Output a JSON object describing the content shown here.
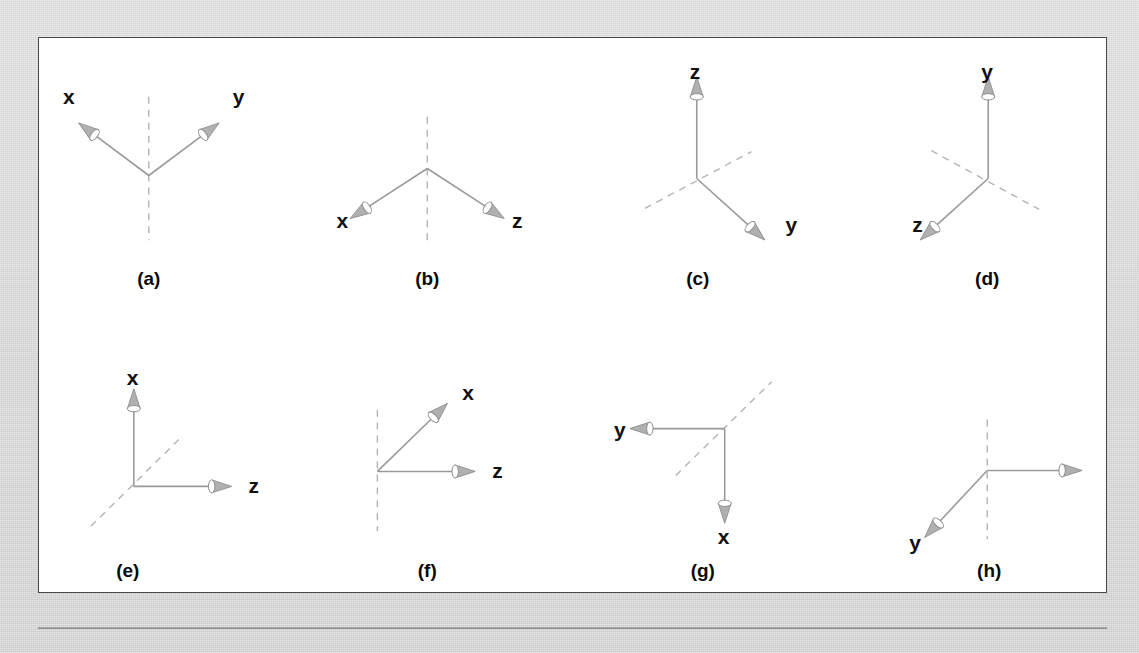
{
  "figure": {
    "background_color": "#d5d5d5",
    "panel_background": "#ffffff",
    "border_color": "#4a4a4a",
    "axis_color": "#9a9a9a",
    "dashed_color": "#b4b4b4",
    "arrow_fill": "#b0b0b0",
    "arrow_stroke": "#8d8d8d",
    "label_color": "#111111",
    "caption_color": "#0a0a0a"
  },
  "chart_data": {
    "type": "diagram",
    "title": "",
    "panels": [
      {
        "caption": "(a)",
        "caption_x": 148,
        "caption_y": 285,
        "origin": [
          148,
          175
        ],
        "solid_axes": [
          {
            "label": "x",
            "dir": [
              -0.8,
              -0.6
            ],
            "length": 88,
            "label_x": 62,
            "label_y": 103
          },
          {
            "label": "y",
            "dir": [
              0.8,
              -0.6
            ],
            "length": 88,
            "label_x": 232,
            "label_y": 103
          }
        ],
        "dashed_axes": [
          {
            "from": [
              148,
              96
            ],
            "to": [
              148,
              240
            ]
          }
        ]
      },
      {
        "caption": "(b)",
        "caption_x": 427,
        "caption_y": 285,
        "origin": [
          427,
          168
        ],
        "solid_axes": [
          {
            "label": "x",
            "dir": [
              -0.8,
              0.52
            ],
            "length": 92,
            "label_x": 336,
            "label_y": 228
          },
          {
            "label": "z",
            "dir": [
              0.8,
              0.52
            ],
            "length": 92,
            "label_x": 512,
            "label_y": 228
          }
        ],
        "dashed_axes": [
          {
            "from": [
              427,
              116
            ],
            "to": [
              427,
              240
            ]
          }
        ]
      },
      {
        "caption": "(c)",
        "caption_x": 698,
        "caption_y": 285,
        "origin": [
          697,
          178
        ],
        "solid_axes": [
          {
            "label": "z",
            "dir": [
              0.0,
              -1.0
            ],
            "length": 102,
            "label_x": 690,
            "label_y": 78
          },
          {
            "label": "y",
            "dir": [
              0.74,
              0.67
            ],
            "length": 92,
            "label_x": 786,
            "label_y": 232
          }
        ],
        "dashed_axes": [
          {
            "from": [
              645,
              208
            ],
            "to": [
              752,
              151
            ]
          }
        ]
      },
      {
        "caption": "(d)",
        "caption_x": 988,
        "caption_y": 285,
        "origin": [
          989,
          178
        ],
        "solid_axes": [
          {
            "label": "y",
            "dir": [
              0.0,
              -1.0
            ],
            "length": 102,
            "label_x": 982,
            "label_y": 78
          },
          {
            "label": "z",
            "dir": [
              -0.74,
              0.67
            ],
            "length": 92,
            "label_x": 913,
            "label_y": 232
          }
        ],
        "dashed_axes": [
          {
            "from": [
              932,
              150
            ],
            "to": [
              1040,
              209
            ]
          }
        ]
      },
      {
        "caption": "(e)",
        "caption_x": 127,
        "caption_y": 578,
        "origin": [
          133,
          487
        ],
        "solid_axes": [
          {
            "label": "x",
            "dir": [
              0.0,
              -1.0
            ],
            "length": 98,
            "label_x": 126,
            "label_y": 385
          },
          {
            "label": "z",
            "dir": [
              1.0,
              0.0
            ],
            "length": 98,
            "label_x": 248,
            "label_y": 494
          }
        ],
        "dashed_axes": [
          {
            "from": [
              90,
              527
            ],
            "to": [
              178,
              440
            ]
          }
        ]
      },
      {
        "caption": "(f)",
        "caption_x": 427,
        "caption_y": 578,
        "origin": [
          377,
          472
        ],
        "solid_axes": [
          {
            "label": "x",
            "dir": [
              0.72,
              -0.7
            ],
            "length": 98,
            "label_x": 462,
            "label_y": 400
          },
          {
            "label": "z",
            "dir": [
              1.0,
              0.0
            ],
            "length": 98,
            "label_x": 492,
            "label_y": 479
          }
        ],
        "dashed_axes": [
          {
            "from": [
              377,
              410
            ],
            "to": [
              377,
              532
            ]
          }
        ]
      },
      {
        "caption": "(g)",
        "caption_x": 703,
        "caption_y": 578,
        "origin": [
          725,
          429
        ],
        "solid_axes": [
          {
            "label": "y",
            "dir": [
              -1.0,
              0.0
            ],
            "length": 95,
            "label_x": 614,
            "label_y": 437
          },
          {
            "label": "x",
            "dir": [
              0.0,
              1.0
            ],
            "length": 95,
            "label_x": 718,
            "label_y": 545
          }
        ],
        "dashed_axes": [
          {
            "from": [
              676,
              476
            ],
            "to": [
              772,
              382
            ]
          }
        ]
      },
      {
        "caption": "(h)",
        "caption_x": 990,
        "caption_y": 578,
        "origin": [
          988,
          471
        ],
        "solid_axes": [
          {
            "label": "z",
            "dir": [
              1.0,
              0.0
            ],
            "length": 95,
            "label_x": 1110,
            "label_y": 479
          },
          {
            "label": "y",
            "dir": [
              -0.68,
              0.73
            ],
            "length": 92,
            "label_x": 910,
            "label_y": 551
          }
        ],
        "dashed_axes": [
          {
            "from": [
              988,
              420
            ],
            "to": [
              988,
              540
            ]
          }
        ]
      }
    ]
  }
}
